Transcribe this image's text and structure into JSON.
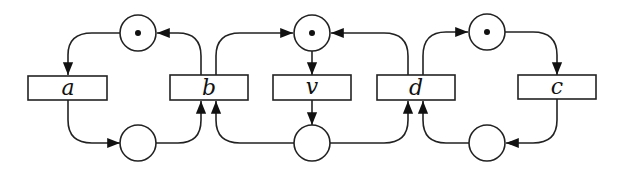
{
  "diagram": {
    "type": "petri-net",
    "transitions": [
      {
        "id": "a",
        "label": "a"
      },
      {
        "id": "b",
        "label": "b"
      },
      {
        "id": "v",
        "label": "v"
      },
      {
        "id": "d",
        "label": "d"
      },
      {
        "id": "c",
        "label": "c"
      }
    ],
    "places": [
      {
        "id": "p1",
        "tokens": 1
      },
      {
        "id": "p2",
        "tokens": 0
      },
      {
        "id": "p3",
        "tokens": 1
      },
      {
        "id": "p4",
        "tokens": 0
      },
      {
        "id": "p5",
        "tokens": 1
      },
      {
        "id": "p6",
        "tokens": 0
      }
    ],
    "arcs": [
      {
        "from": "p1",
        "to": "a"
      },
      {
        "from": "a",
        "to": "p2"
      },
      {
        "from": "p2",
        "to": "b"
      },
      {
        "from": "b",
        "to": "p1"
      },
      {
        "from": "b",
        "to": "p3"
      },
      {
        "from": "p3",
        "to": "v"
      },
      {
        "from": "v",
        "to": "p4"
      },
      {
        "from": "p4",
        "to": "b"
      },
      {
        "from": "p4",
        "to": "d"
      },
      {
        "from": "d",
        "to": "p3"
      },
      {
        "from": "d",
        "to": "p5"
      },
      {
        "from": "p5",
        "to": "c"
      },
      {
        "from": "c",
        "to": "p6"
      },
      {
        "from": "p6",
        "to": "d"
      }
    ]
  }
}
